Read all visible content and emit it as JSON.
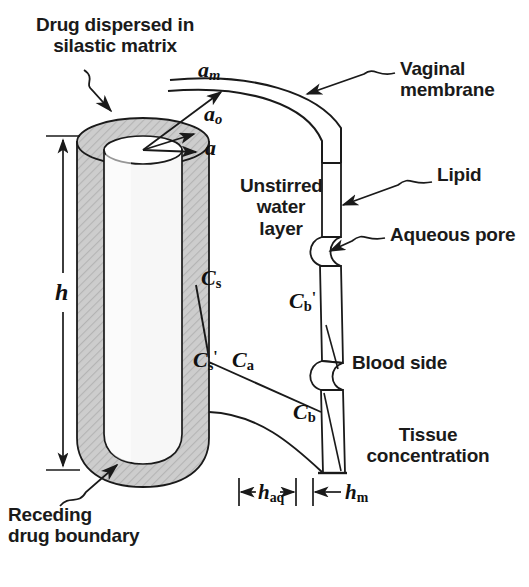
{
  "figure": {
    "background_color": "#ffffff",
    "ink_color": "#1a1a1a",
    "matrix_fill_color": "#c9c9c9",
    "width": 529,
    "height": 587
  },
  "annotations": {
    "drug_dispersed": "Drug dispersed in\nsilastic matrix",
    "receding_boundary": "Receding\ndrug boundary",
    "vaginal_membrane": "Vaginal\nmembrane",
    "lipid": "Lipid",
    "aqueous_pore": "Aqueous pore",
    "unstirred_water_layer": "Unstirred\nwater\nlayer",
    "blood_side": "Blood side",
    "tissue_concentration": "Tissue\nconcentration"
  },
  "symbols": {
    "radius_inner": {
      "base": "a",
      "sub": "",
      "desc": "inner cavity radius"
    },
    "radius_outer": {
      "base": "a",
      "sub": "o",
      "desc": "outer device radius"
    },
    "radius_membrane": {
      "base": "a",
      "sub": "m",
      "desc": "radius to vaginal membrane"
    },
    "height": {
      "base": "h",
      "sub": "",
      "desc": "device height"
    },
    "h_aq": {
      "base": "h",
      "sub": "aq",
      "desc": "unstirred aqueous layer thickness"
    },
    "h_m": {
      "base": "h",
      "sub": "m",
      "desc": "membrane thickness"
    },
    "C_s": {
      "base": "C",
      "sub": "s",
      "prime": "",
      "desc": "drug solubility in matrix"
    },
    "C_s_prime": {
      "base": "C",
      "sub": "s",
      "prime": "'",
      "desc": "concentration at matrix surface"
    },
    "C_a": {
      "base": "C",
      "sub": "a",
      "prime": "",
      "desc": "aqueous concentration"
    },
    "C_b_prime": {
      "base": "C",
      "sub": "b",
      "prime": "'",
      "desc": "concentration at membrane inner face"
    },
    "C_b": {
      "base": "C",
      "sub": "b",
      "prime": "",
      "desc": "blood side concentration"
    }
  },
  "dimension_labels": {
    "h": "h",
    "h_aq_sub": "aq",
    "h_m_sub": "m"
  }
}
